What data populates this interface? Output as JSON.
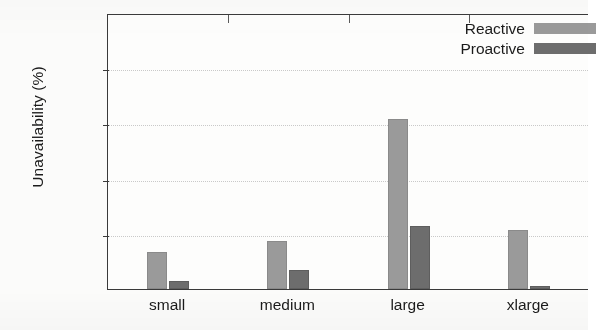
{
  "chart_data": {
    "type": "bar",
    "title": "",
    "subtitle": "",
    "xlabel": "",
    "ylabel": "Unavailability (%)",
    "categories": [
      "small",
      "medium",
      "large",
      "xlarge"
    ],
    "series": [
      {
        "name": "Reactive",
        "color": "#9a9a9a",
        "values": [
          0.0135,
          0.0175,
          0.0617,
          0.0215
        ]
      },
      {
        "name": "Proactive",
        "color": "#6d6d6d",
        "values": [
          0.003,
          0.0068,
          0.0228,
          0.0012
        ]
      }
    ],
    "ylim": [
      0,
      0.1
    ],
    "yticks": [
      0,
      0.02,
      0.04,
      0.06,
      0.08,
      0.1
    ],
    "ytick_labels": [
      "0",
      "0.02",
      "0.04",
      "0.06",
      "0.08",
      "0.1"
    ],
    "grid": true,
    "grid_axis": "y",
    "grid_style": "dotted",
    "legend_position": "top-right",
    "legend_entries": [
      "Reactive",
      "Proactive"
    ],
    "annotations": []
  },
  "axis": {
    "y_title": "Unavailability (%)"
  }
}
